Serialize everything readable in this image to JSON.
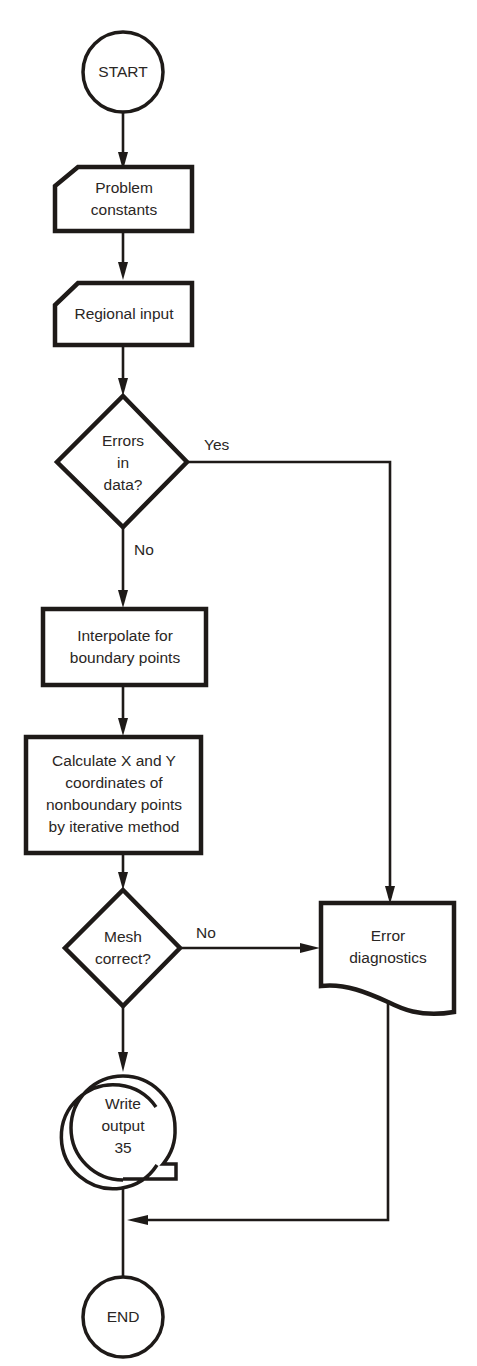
{
  "diagram": {
    "type": "flowchart",
    "nodes": {
      "start": {
        "shape": "terminal-circle",
        "label": "START"
      },
      "problem_constants": {
        "shape": "manual-input",
        "label": "Problem\nconstants"
      },
      "regional_input": {
        "shape": "manual-input",
        "label": "Regional input"
      },
      "errors_in_data": {
        "shape": "decision",
        "label": "Errors\nin\ndata?"
      },
      "interpolate": {
        "shape": "process",
        "label": "Interpolate for\nboundary points"
      },
      "calculate": {
        "shape": "process",
        "label": "Calculate X and Y\n coordinates of\nnonboundary points\nby iterative method"
      },
      "mesh_correct": {
        "shape": "decision",
        "label": "Mesh\ncorrect?"
      },
      "error_diagnostics": {
        "shape": "document",
        "label": "Error\ndiagnostics"
      },
      "write_output": {
        "shape": "magnetic-tape",
        "label": "Write\noutput\n35"
      },
      "end": {
        "shape": "terminal-circle",
        "label": "END"
      }
    },
    "edges": [
      {
        "from": "start",
        "to": "problem_constants",
        "label": ""
      },
      {
        "from": "problem_constants",
        "to": "regional_input",
        "label": ""
      },
      {
        "from": "regional_input",
        "to": "errors_in_data",
        "label": ""
      },
      {
        "from": "errors_in_data",
        "to": "error_diagnostics",
        "label": "Yes"
      },
      {
        "from": "errors_in_data",
        "to": "interpolate",
        "label": "No"
      },
      {
        "from": "interpolate",
        "to": "calculate",
        "label": ""
      },
      {
        "from": "calculate",
        "to": "mesh_correct",
        "label": ""
      },
      {
        "from": "mesh_correct",
        "to": "error_diagnostics",
        "label": "No"
      },
      {
        "from": "mesh_correct",
        "to": "write_output",
        "label": ""
      },
      {
        "from": "write_output",
        "to": "end",
        "label": ""
      },
      {
        "from": "error_diagnostics",
        "to": "end",
        "label": ""
      }
    ],
    "edge_labels": {
      "errors_yes": "Yes",
      "errors_no": "No",
      "mesh_no": "No"
    },
    "colors": {
      "stroke": "#1e1a18",
      "text": "#2a2624",
      "background": "#ffffff"
    }
  }
}
